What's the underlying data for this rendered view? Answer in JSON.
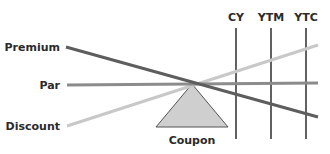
{
  "diagram": {
    "colors": {
      "premium_line": "#5e5e5e",
      "par_line": "#8c8c8c",
      "discount_line": "#c8c8c8",
      "vertical_line": "#3a3a3a",
      "triangle_fill": "#cfcfcf",
      "triangle_stroke": "#555555",
      "text": "#2b2b2b"
    },
    "left_labels": {
      "premium": "Premium",
      "par": "Par",
      "discount": "Discount"
    },
    "column_labels": {
      "cy": "CY",
      "ytm": "YTM",
      "ytc": "YTC"
    },
    "fulcrum_label": "Coupon"
  }
}
